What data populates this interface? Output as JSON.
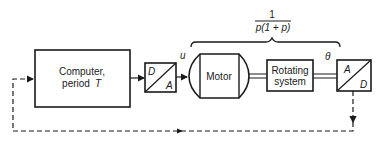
{
  "diagram": {
    "computer": {
      "line1": "Computer,",
      "line2": "period",
      "period_symbol": "T"
    },
    "dac": {
      "top": "D",
      "bottom": "A"
    },
    "signal_u": "u",
    "motor": {
      "label": "Motor"
    },
    "rotating_system": {
      "line1": "Rotating",
      "line2": "system"
    },
    "signal_theta": "θ",
    "adc": {
      "top": "A",
      "bottom": "D"
    },
    "transfer_function": {
      "numerator": "1",
      "denominator": "p(1 + p)"
    },
    "colors": {
      "stroke": "#1a1a1a",
      "background": "#ffffff"
    }
  }
}
